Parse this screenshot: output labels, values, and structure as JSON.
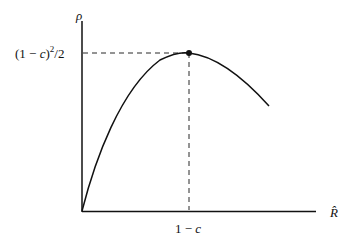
{
  "diagram": {
    "y_axis_label": "ρ",
    "x_axis_label": "R̂",
    "peak_y_label_prefix": "(1 − ",
    "peak_y_label_c": "c",
    "peak_y_label_close": ")",
    "peak_y_label_exp": "2",
    "peak_y_label_suffix": "/2",
    "peak_x_label_prefix": "1 − ",
    "peak_x_label_c": "c",
    "colors": {
      "ink": "#111111",
      "background": "#ffffff"
    }
  }
}
